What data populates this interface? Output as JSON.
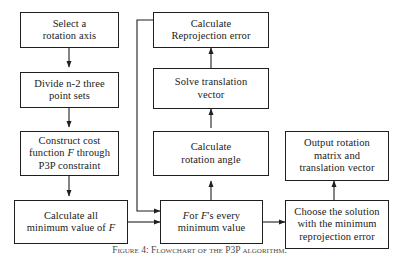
{
  "figure": {
    "caption": "Figure 4: Flowchart of the P3P algorithm.",
    "stroke_color": "#1f1f1f",
    "background_color": "#ffffff",
    "text_color": "#1a1a1a"
  },
  "nodes": {
    "select_rotation_axis": {
      "label": "Select a\nrotation axis",
      "column": "left",
      "order": 1
    },
    "divide_point_sets": {
      "label": "Divide n-2 three\npoint sets",
      "column": "left",
      "order": 2
    },
    "construct_cost_function": {
      "label": "Construct cost\nfunction F through\nP3P constraint",
      "italic_token": "F",
      "column": "left",
      "order": 3
    },
    "calculate_minimum_values": {
      "label": "Calculate all\nminimum value of F",
      "italic_token": "F",
      "column": "left",
      "order": 4
    },
    "calculate_reprojection_error": {
      "label": "Calculate\nReprojection error",
      "column": "middle",
      "order": 1
    },
    "solve_translation_vector": {
      "label": "Solve translation\nvector",
      "column": "middle",
      "order": 2
    },
    "calculate_rotation_angle": {
      "label": "Calculate\nrotation angle",
      "column": "middle",
      "order": 3
    },
    "for_every_minimum_value": {
      "label": "For F's every\nminimum value",
      "italic_token": "F",
      "column": "middle",
      "order": 4
    },
    "output_rotation_matrix": {
      "label": "Output rotation\nmatrix and\ntranslation vector",
      "column": "right",
      "order": 1
    },
    "choose_solution": {
      "label": "Choose the solution\nwith the minimum\nreprojection error",
      "column": "right",
      "order": 2
    }
  },
  "edges": [
    {
      "from": "select_rotation_axis",
      "to": "divide_point_sets",
      "style": "straight-down"
    },
    {
      "from": "divide_point_sets",
      "to": "construct_cost_function",
      "style": "straight-down"
    },
    {
      "from": "construct_cost_function",
      "to": "calculate_minimum_values",
      "style": "straight-down"
    },
    {
      "from": "calculate_minimum_values",
      "to": "for_every_minimum_value",
      "style": "straight-right"
    },
    {
      "from": "for_every_minimum_value",
      "to": "calculate_rotation_angle",
      "style": "straight-up"
    },
    {
      "from": "calculate_rotation_angle",
      "to": "solve_translation_vector",
      "style": "straight-up"
    },
    {
      "from": "solve_translation_vector",
      "to": "calculate_reprojection_error",
      "style": "straight-up"
    },
    {
      "from": "calculate_reprojection_error",
      "to": "for_every_minimum_value",
      "style": "feedback-left-down"
    },
    {
      "from": "for_every_minimum_value",
      "to": "choose_solution",
      "style": "straight-right"
    },
    {
      "from": "choose_solution",
      "to": "output_rotation_matrix",
      "style": "straight-up"
    }
  ]
}
